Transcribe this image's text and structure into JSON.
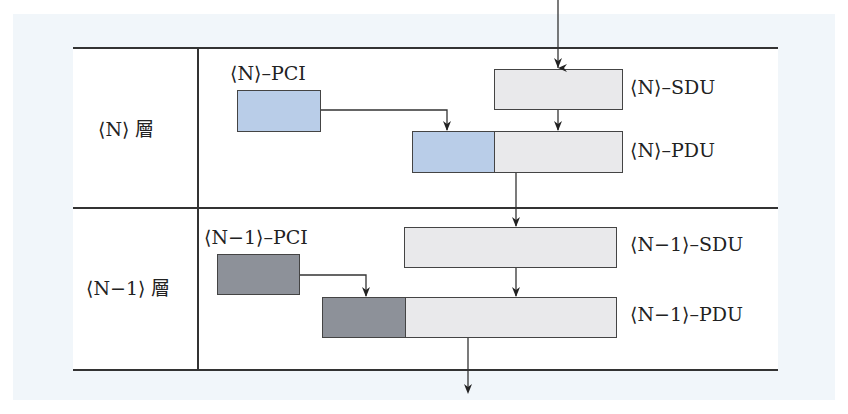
{
  "diagram": {
    "type": "protocol-layer-encapsulation",
    "layers": [
      {
        "id": "N",
        "label": "⟨N⟩ 層"
      },
      {
        "id": "N-1",
        "label": "⟨N−1⟩ 層"
      }
    ],
    "blocks": {
      "n_pci": {
        "label": "⟨N⟩–PCI",
        "color": "#b9cde8"
      },
      "n_sdu": {
        "label": "⟨N⟩–SDU",
        "color": "#e9e9eb"
      },
      "n_pdu": {
        "label": "⟨N⟩–PDU",
        "header_color": "#b9cde8",
        "body_color": "#e9e9eb"
      },
      "n1_pci": {
        "label": "⟨N−1⟩–PCI",
        "color": "#8d9199"
      },
      "n1_sdu": {
        "label": "⟨N−1⟩–SDU",
        "color": "#e9e9eb"
      },
      "n1_pdu": {
        "label": "⟨N−1⟩–PDU",
        "header_color": "#8d9199",
        "body_color": "#e9e9eb"
      }
    },
    "flows": [
      "input → ⟨N⟩–SDU",
      "⟨N⟩–SDU → ⟨N⟩–PDU (body)",
      "⟨N⟩–PCI → ⟨N⟩–PDU (header)",
      "⟨N⟩–PDU → ⟨N−1⟩–SDU",
      "⟨N−1⟩–SDU → ⟨N−1⟩–PDU (body)",
      "⟨N−1⟩–PCI → ⟨N−1⟩–PDU (header)",
      "⟨N−1⟩–PDU → output"
    ]
  }
}
